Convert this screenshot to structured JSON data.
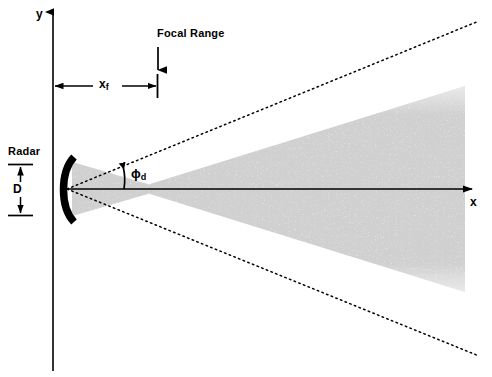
{
  "figure": {
    "background_color": "#ffffff",
    "ink_color": "#000000",
    "beam_color": "#c8c8c8"
  },
  "axes": {
    "y_label": "y",
    "x_label": "x",
    "origin_px": [
      53,
      189
    ],
    "x_axis_start_px": [
      67,
      189
    ],
    "x_axis_end_px": [
      480,
      189
    ],
    "y_axis_top_px": [
      53,
      10
    ],
    "y_axis_bottom_px": [
      53,
      371
    ]
  },
  "annotations": {
    "focal_range_label": "Focal Range",
    "focal_range_arrow": {
      "from_px": [
        158,
        48
      ],
      "to_px": [
        158,
        72
      ],
      "direction": "down"
    },
    "focal_distance": {
      "symbol": "x",
      "subscript": "f",
      "from_px": [
        53,
        86
      ],
      "to_px": [
        158,
        86
      ]
    },
    "aperture": {
      "label": "D",
      "radar_label": "Radar",
      "from_px": [
        20,
        164
      ],
      "to_px": [
        20,
        216
      ]
    },
    "divergence_angle": {
      "symbol": "ϕ",
      "subscript": "d",
      "arc_center_px": [
        67,
        189
      ],
      "arc_radius_px": 56
    }
  },
  "radar": {
    "shape": "concave-arc",
    "top_px": [
      72,
      157
    ],
    "bottom_px": [
      72,
      222
    ],
    "bulge": "left",
    "thickness_px": 7,
    "color": "#000000"
  },
  "beam": {
    "description": "stippled gray converging-diverging beam",
    "vertex_px": [
      67,
      189
    ],
    "waist_x_px": 155,
    "right_edge_x_px": 465,
    "half_angle_slope": 0.4
  },
  "dotted_lines": [
    {
      "name": "upper-divergence-line",
      "from_px": [
        67,
        189
      ],
      "to_px": [
        479,
        21
      ]
    },
    {
      "name": "lower-divergence-line",
      "from_px": [
        67,
        189
      ],
      "to_px": [
        479,
        356
      ]
    }
  ]
}
